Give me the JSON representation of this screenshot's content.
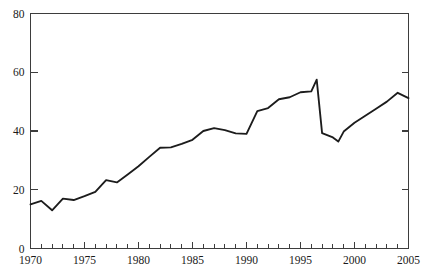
{
  "chart_data": {
    "type": "line",
    "title": "",
    "subtitle": "",
    "xlabel": "",
    "ylabel": "",
    "xlim": [
      1970,
      2005
    ],
    "ylim": [
      0,
      80
    ],
    "grid": false,
    "legend": null,
    "legend_position": "none",
    "y_ticks": [
      0,
      20,
      40,
      60,
      80
    ],
    "y_tick_labels": [
      "0",
      "20",
      "40",
      "60",
      "80"
    ],
    "x_ticks": [
      1970,
      1975,
      1980,
      1985,
      1990,
      1995,
      2000,
      2005
    ],
    "x_tick_labels": [
      "1970",
      "1975",
      "1980",
      "1985",
      "1990",
      "1995",
      "2000",
      "2005"
    ],
    "x_minor_tick_interval": 1,
    "series": [
      {
        "name": "series-1",
        "color": "#1c1c1c",
        "x": [
          1970,
          1971,
          1972,
          1973,
          1974,
          1975,
          1976,
          1977,
          1978,
          1979,
          1980,
          1981,
          1982,
          1983,
          1984,
          1985,
          1986,
          1987,
          1988,
          1989,
          1990,
          1991,
          1992,
          1993,
          1994,
          1995,
          1996,
          1996.5,
          1997,
          1998,
          1998.5,
          1999,
          2000,
          2001,
          2002,
          2003,
          2004,
          2005
        ],
        "values": [
          15.0,
          16.2,
          13.0,
          17.0,
          16.5,
          17.8,
          19.3,
          23.3,
          22.5,
          25.2,
          28.0,
          31.2,
          34.3,
          34.4,
          35.6,
          37.0,
          40.0,
          41.0,
          40.3,
          39.2,
          39.0,
          46.8,
          47.8,
          50.8,
          51.5,
          53.2,
          53.5,
          57.5,
          39.3,
          37.8,
          36.4,
          39.8,
          42.8,
          45.2,
          47.6,
          50.0,
          53.0,
          51.2
        ]
      }
    ]
  },
  "axis": {
    "y_axis_name": "y-axis",
    "x_axis_name": "x-axis"
  }
}
